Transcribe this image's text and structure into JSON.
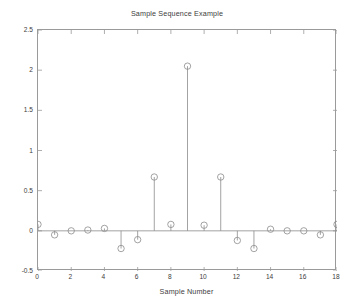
{
  "chart_data": {
    "type": "scatter",
    "plot_style": "stem",
    "title": "Sample Sequence Example",
    "xlabel": "Sample Number",
    "ylabel": "",
    "xlim": [
      0,
      18
    ],
    "ylim": [
      -0.5,
      2.5
    ],
    "xticks": [
      0,
      2,
      4,
      6,
      8,
      10,
      12,
      14,
      16,
      18
    ],
    "xtick_labels": [
      "0",
      "2",
      "4",
      "6",
      "8",
      "10",
      "12",
      "14",
      "16",
      "18"
    ],
    "yticks": [
      -0.5,
      0,
      0.5,
      1,
      1.5,
      2,
      2.5
    ],
    "ytick_labels": [
      "-0.5",
      "0",
      "0.5",
      "1",
      "1.5",
      "2",
      "2.5"
    ],
    "grid": false,
    "legend": null,
    "x": [
      0,
      1,
      2,
      3,
      4,
      5,
      6,
      7,
      8,
      9,
      10,
      11,
      12,
      13,
      14,
      15,
      16,
      17,
      18
    ],
    "values": [
      0.08,
      -0.05,
      0.0,
      0.01,
      0.03,
      -0.22,
      -0.11,
      0.67,
      0.08,
      2.05,
      0.07,
      0.67,
      -0.12,
      -0.22,
      0.02,
      0.0,
      0.0,
      -0.05,
      0.08
    ],
    "marker": "circle-open",
    "marker_size": 3.2,
    "line_color": "#8c8c8c",
    "marker_color": "#8c8c8c",
    "axis_color": "#9a9a9a",
    "baseline_value": 0,
    "background_color": "#ffffff",
    "text_color": "#3c3c3c"
  }
}
